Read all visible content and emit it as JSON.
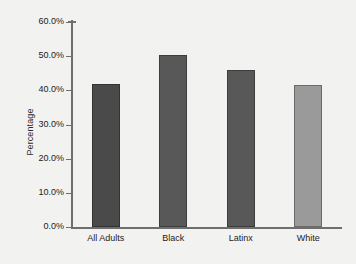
{
  "chart_data": {
    "type": "bar",
    "title": "",
    "subtitle": "",
    "xlabel": "",
    "ylabel": "Percentage",
    "categories": [
      "All Adults",
      "Black",
      "Latinx",
      "White"
    ],
    "values": [
      42.0,
      50.2,
      46.1,
      41.5
    ],
    "value_labels": [
      "42.0%",
      "50.2%",
      "46.1%",
      "41.5%"
    ],
    "colors": [
      "#4a4a4a",
      "#585858",
      "#585858",
      "#9a9a9a"
    ],
    "ylim": [
      0,
      60
    ],
    "yticks": [
      0,
      10,
      20,
      30,
      40,
      50,
      60
    ],
    "ytick_labels": [
      "0.0%",
      "10.0%",
      "20.0%",
      "30.0%",
      "40.0%",
      "50.0%",
      "60.0%"
    ],
    "grid": false,
    "legend": false,
    "legend_position": "none",
    "background_color": "#f2f2f0",
    "axis_color": "#6e6e6e"
  }
}
